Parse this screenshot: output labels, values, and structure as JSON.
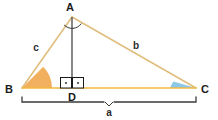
{
  "diagram": {
    "type": "triangle-with-altitude",
    "colors": {
      "triangle_stroke": "#E8C98A",
      "base_stroke": "#F0B93F",
      "altitude_stroke": "#555555",
      "angle_b_fill": "#F2B05E",
      "angle_c_fill": "#8CC8E8",
      "label_text": "#1a1a1a",
      "bracket_stroke": "#3a3a3a",
      "right_angle_stroke": "#1a1a1a",
      "background": "#ffffff"
    },
    "vertices": [
      {
        "id": "A",
        "label": "A",
        "x": 72,
        "y": 17,
        "label_x": 70,
        "label_y": 11
      },
      {
        "id": "B",
        "label": "B",
        "x": 22,
        "y": 88,
        "label_x": 9,
        "label_y": 93
      },
      {
        "id": "C",
        "label": "C",
        "x": 196,
        "y": 88,
        "label_x": 202,
        "label_y": 93
      },
      {
        "id": "D",
        "label": "D",
        "x": 72,
        "y": 88,
        "label_x": 68,
        "label_y": 101
      }
    ],
    "sides": [
      {
        "id": "c",
        "label": "c",
        "from": "A",
        "to": "B",
        "label_x": 36,
        "label_y": 51
      },
      {
        "id": "b",
        "label": "b",
        "from": "A",
        "to": "C",
        "label_x": 136,
        "label_y": 49
      },
      {
        "id": "a",
        "label": "a",
        "from": "B",
        "to": "C",
        "label_x": 109,
        "label_y": 114
      }
    ],
    "angle_markers": [
      {
        "id": "angle-a",
        "at": "A",
        "style": "arc",
        "filled": false
      },
      {
        "id": "angle-b",
        "at": "B",
        "style": "sector",
        "filled": true,
        "fill": "#F2B05E"
      },
      {
        "id": "angle-c",
        "at": "C",
        "style": "sector",
        "filled": true,
        "fill": "#8CC8E8"
      }
    ],
    "right_angle_markers": [
      {
        "id": "right-angle-left",
        "at": "D",
        "side": "left"
      },
      {
        "id": "right-angle-right",
        "at": "D",
        "side": "right"
      }
    ],
    "measurement_bracket": {
      "id": "base-bracket",
      "label": "a",
      "from_x": 22,
      "to_x": 196,
      "y": 102
    }
  }
}
